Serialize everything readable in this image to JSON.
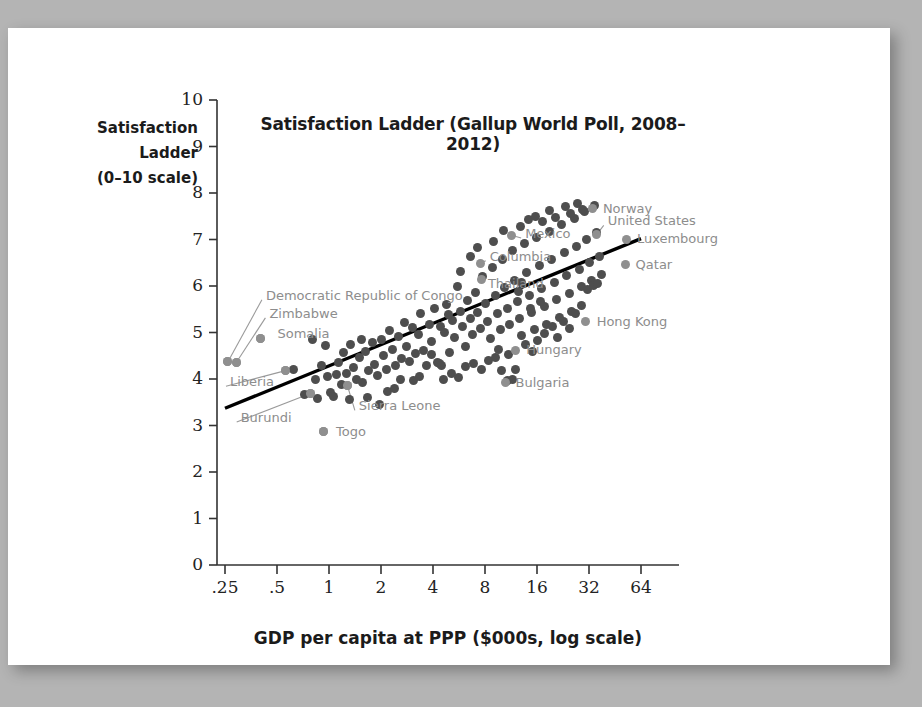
{
  "figure": {
    "title": "Satisfaction Ladder (Gallup World Poll, 2008–2012)",
    "y_axis_title_line1": "Satisfaction",
    "y_axis_title_line2": "Ladder",
    "y_axis_title_line3": "(0–10 scale)",
    "x_axis_title": "GDP per capita at PPP ($000s, log scale)"
  },
  "chart_data": {
    "type": "scatter",
    "title": "Satisfaction Ladder (Gallup World Poll, 2008–2012)",
    "xlabel": "GDP per capita at PPP ($000s, log scale)",
    "ylabel": "Satisfaction Ladder (0–10 scale)",
    "xscale": "log2",
    "xlim": [
      0.22,
      72
    ],
    "ylim": [
      0,
      10
    ],
    "grid": false,
    "legend": "none",
    "xticks": [
      0.25,
      0.5,
      1,
      2,
      4,
      8,
      16,
      32,
      64
    ],
    "xtick_labels": [
      ".25",
      ".5",
      "1",
      "2",
      "4",
      "8",
      "16",
      "32",
      "64"
    ],
    "yticks": [
      0,
      1,
      2,
      3,
      4,
      5,
      6,
      7,
      8,
      9,
      10
    ],
    "ytick_labels": [
      "0",
      "1",
      "2",
      "3",
      "4",
      "5",
      "6",
      "7",
      "8",
      "9",
      "10"
    ],
    "trend_line": {
      "label": "linear fit on log GDP",
      "x_start": 0.25,
      "y_start": 3.37,
      "x_end": 64.0,
      "y_end": 7.02,
      "color": "#000000"
    },
    "point_color": "#4e4e4e",
    "highlight_color": "#8f8f8f",
    "labeled_points": [
      {
        "name": "Democratic Republic of Congo",
        "x": 0.26,
        "y": 4.37,
        "label_x": 0.42,
        "label_y": 5.79,
        "leader": true
      },
      {
        "name": "Zimbabwe",
        "x": 0.29,
        "y": 4.35,
        "label_x": 0.44,
        "label_y": 5.4,
        "leader": true
      },
      {
        "name": "Somalia",
        "x": 0.4,
        "y": 4.88,
        "label_x": 0.49,
        "label_y": 4.97,
        "leader": false
      },
      {
        "name": "Liberia",
        "x": 0.56,
        "y": 4.18,
        "label_x": 0.26,
        "label_y": 3.93,
        "leader": true
      },
      {
        "name": "Burundi",
        "x": 0.78,
        "y": 3.69,
        "label_x": 0.3,
        "label_y": 3.16,
        "leader": true
      },
      {
        "name": "Sierra Leone",
        "x": 1.28,
        "y": 3.85,
        "label_x": 1.45,
        "label_y": 3.41,
        "leader": true
      },
      {
        "name": "Togo",
        "x": 0.93,
        "y": 2.87,
        "label_x": 1.07,
        "label_y": 2.87,
        "leader": false
      },
      {
        "name": "Thailand",
        "x": 7.6,
        "y": 6.13,
        "label_x": 8.1,
        "label_y": 6.04,
        "leader": false
      },
      {
        "name": "Columbia",
        "x": 7.5,
        "y": 6.48,
        "label_x": 8.3,
        "label_y": 6.63,
        "leader": true
      },
      {
        "name": "Mexico",
        "x": 11.4,
        "y": 7.09,
        "label_x": 13.3,
        "label_y": 7.12,
        "leader": true
      },
      {
        "name": "Bulgaria",
        "x": 10.5,
        "y": 3.92,
        "label_x": 11.7,
        "label_y": 3.92,
        "leader": false
      },
      {
        "name": "Hungary",
        "x": 12.0,
        "y": 4.62,
        "label_x": 13.5,
        "label_y": 4.62,
        "leader": false
      },
      {
        "name": "Hong Kong",
        "x": 30.5,
        "y": 5.23,
        "label_x": 34.5,
        "label_y": 5.23,
        "leader": false
      },
      {
        "name": "Norway",
        "x": 33.5,
        "y": 7.66,
        "label_x": 37.5,
        "label_y": 7.66,
        "leader": false
      },
      {
        "name": "United States",
        "x": 35.5,
        "y": 7.11,
        "label_x": 40.0,
        "label_y": 7.39,
        "leader": true
      },
      {
        "name": "Luxembourg",
        "x": 53.0,
        "y": 7.01,
        "label_x": 59.0,
        "label_y": 7.01,
        "leader": false
      },
      {
        "name": "Qatar",
        "x": 52.0,
        "y": 6.46,
        "label_x": 58.0,
        "label_y": 6.46,
        "leader": false
      }
    ],
    "points": [
      {
        "x": 0.26,
        "y": 4.37
      },
      {
        "x": 0.29,
        "y": 4.35
      },
      {
        "x": 0.4,
        "y": 4.88
      },
      {
        "x": 0.56,
        "y": 4.18
      },
      {
        "x": 0.78,
        "y": 3.69
      },
      {
        "x": 1.28,
        "y": 3.85
      },
      {
        "x": 0.93,
        "y": 2.87
      },
      {
        "x": 0.62,
        "y": 4.2
      },
      {
        "x": 0.72,
        "y": 3.66
      },
      {
        "x": 0.8,
        "y": 4.84
      },
      {
        "x": 0.83,
        "y": 4.0
      },
      {
        "x": 0.86,
        "y": 3.58
      },
      {
        "x": 0.9,
        "y": 4.28
      },
      {
        "x": 0.95,
        "y": 4.72
      },
      {
        "x": 0.98,
        "y": 4.05
      },
      {
        "x": 1.02,
        "y": 3.7
      },
      {
        "x": 1.06,
        "y": 3.62
      },
      {
        "x": 1.1,
        "y": 4.09
      },
      {
        "x": 1.14,
        "y": 4.36
      },
      {
        "x": 1.18,
        "y": 3.88
      },
      {
        "x": 1.22,
        "y": 4.58
      },
      {
        "x": 1.26,
        "y": 4.12
      },
      {
        "x": 1.32,
        "y": 3.55
      },
      {
        "x": 1.38,
        "y": 4.24
      },
      {
        "x": 1.44,
        "y": 4.0
      },
      {
        "x": 1.5,
        "y": 4.46
      },
      {
        "x": 1.56,
        "y": 3.92
      },
      {
        "x": 1.62,
        "y": 4.6
      },
      {
        "x": 1.7,
        "y": 4.18
      },
      {
        "x": 1.78,
        "y": 4.78
      },
      {
        "x": 1.84,
        "y": 4.32
      },
      {
        "x": 1.92,
        "y": 4.08
      },
      {
        "x": 2.0,
        "y": 4.86
      },
      {
        "x": 2.08,
        "y": 4.5
      },
      {
        "x": 2.16,
        "y": 4.2
      },
      {
        "x": 2.24,
        "y": 5.04
      },
      {
        "x": 2.34,
        "y": 4.64
      },
      {
        "x": 2.44,
        "y": 4.3
      },
      {
        "x": 2.54,
        "y": 4.92
      },
      {
        "x": 2.62,
        "y": 4.44
      },
      {
        "x": 2.72,
        "y": 5.22
      },
      {
        "x": 2.82,
        "y": 4.7
      },
      {
        "x": 2.94,
        "y": 4.38
      },
      {
        "x": 3.04,
        "y": 5.1
      },
      {
        "x": 3.16,
        "y": 4.55
      },
      {
        "x": 3.28,
        "y": 4.95
      },
      {
        "x": 3.4,
        "y": 5.4
      },
      {
        "x": 3.52,
        "y": 4.62
      },
      {
        "x": 3.66,
        "y": 4.28
      },
      {
        "x": 3.8,
        "y": 5.18
      },
      {
        "x": 3.94,
        "y": 4.8
      },
      {
        "x": 4.08,
        "y": 5.52
      },
      {
        "x": 4.22,
        "y": 4.36
      },
      {
        "x": 4.36,
        "y": 4.34
      },
      {
        "x": 4.5,
        "y": 4.3
      },
      {
        "x": 4.66,
        "y": 5.0
      },
      {
        "x": 4.82,
        "y": 5.6
      },
      {
        "x": 5.0,
        "y": 4.58
      },
      {
        "x": 5.18,
        "y": 5.26
      },
      {
        "x": 5.36,
        "y": 4.9
      },
      {
        "x": 5.54,
        "y": 6.0
      },
      {
        "x": 5.74,
        "y": 5.46
      },
      {
        "x": 5.94,
        "y": 5.12
      },
      {
        "x": 6.14,
        "y": 4.7
      },
      {
        "x": 6.36,
        "y": 5.68
      },
      {
        "x": 6.58,
        "y": 5.3
      },
      {
        "x": 6.8,
        "y": 4.96
      },
      {
        "x": 7.04,
        "y": 5.86
      },
      {
        "x": 7.28,
        "y": 5.44
      },
      {
        "x": 7.52,
        "y": 5.08
      },
      {
        "x": 7.78,
        "y": 6.2
      },
      {
        "x": 8.04,
        "y": 5.62
      },
      {
        "x": 8.3,
        "y": 5.24
      },
      {
        "x": 8.58,
        "y": 4.88
      },
      {
        "x": 8.86,
        "y": 6.4
      },
      {
        "x": 9.16,
        "y": 5.8
      },
      {
        "x": 9.46,
        "y": 5.4
      },
      {
        "x": 9.78,
        "y": 5.06
      },
      {
        "x": 10.1,
        "y": 6.56
      },
      {
        "x": 10.4,
        "y": 5.96
      },
      {
        "x": 10.8,
        "y": 5.52
      },
      {
        "x": 11.1,
        "y": 5.18
      },
      {
        "x": 11.5,
        "y": 6.76
      },
      {
        "x": 11.9,
        "y": 6.12
      },
      {
        "x": 12.3,
        "y": 5.66
      },
      {
        "x": 12.7,
        "y": 5.3
      },
      {
        "x": 13.1,
        "y": 4.94
      },
      {
        "x": 13.5,
        "y": 6.92
      },
      {
        "x": 14.0,
        "y": 6.28
      },
      {
        "x": 14.4,
        "y": 5.8
      },
      {
        "x": 14.9,
        "y": 5.42
      },
      {
        "x": 15.4,
        "y": 5.06
      },
      {
        "x": 15.9,
        "y": 7.04
      },
      {
        "x": 16.5,
        "y": 6.44
      },
      {
        "x": 17.0,
        "y": 5.94
      },
      {
        "x": 17.6,
        "y": 5.56
      },
      {
        "x": 18.2,
        "y": 5.18
      },
      {
        "x": 18.8,
        "y": 7.18
      },
      {
        "x": 19.4,
        "y": 6.58
      },
      {
        "x": 20.1,
        "y": 6.08
      },
      {
        "x": 20.8,
        "y": 5.7
      },
      {
        "x": 21.5,
        "y": 5.32
      },
      {
        "x": 22.2,
        "y": 7.32
      },
      {
        "x": 23.0,
        "y": 6.72
      },
      {
        "x": 23.8,
        "y": 6.22
      },
      {
        "x": 24.6,
        "y": 5.84
      },
      {
        "x": 25.4,
        "y": 5.46
      },
      {
        "x": 26.3,
        "y": 7.46
      },
      {
        "x": 27.2,
        "y": 6.86
      },
      {
        "x": 28.1,
        "y": 6.36
      },
      {
        "x": 29.0,
        "y": 5.98
      },
      {
        "x": 30.0,
        "y": 7.6
      },
      {
        "x": 31.0,
        "y": 7.0
      },
      {
        "x": 32.1,
        "y": 6.5
      },
      {
        "x": 33.2,
        "y": 6.12
      },
      {
        "x": 34.3,
        "y": 7.74
      },
      {
        "x": 35.5,
        "y": 7.14
      },
      {
        "x": 36.7,
        "y": 6.64
      },
      {
        "x": 37.9,
        "y": 6.24
      },
      {
        "x": 3.1,
        "y": 3.96
      },
      {
        "x": 3.34,
        "y": 4.06
      },
      {
        "x": 2.18,
        "y": 3.74
      },
      {
        "x": 2.4,
        "y": 3.8
      },
      {
        "x": 1.66,
        "y": 3.6
      },
      {
        "x": 1.96,
        "y": 3.46
      },
      {
        "x": 4.6,
        "y": 3.98
      },
      {
        "x": 5.1,
        "y": 4.12
      },
      {
        "x": 5.6,
        "y": 4.04
      },
      {
        "x": 6.2,
        "y": 4.26
      },
      {
        "x": 6.9,
        "y": 4.34
      },
      {
        "x": 7.6,
        "y": 4.2
      },
      {
        "x": 8.4,
        "y": 4.4
      },
      {
        "x": 9.2,
        "y": 4.46
      },
      {
        "x": 10.0,
        "y": 4.18
      },
      {
        "x": 11.0,
        "y": 4.52
      },
      {
        "x": 12.0,
        "y": 4.2
      },
      {
        "x": 10.8,
        "y": 3.96
      },
      {
        "x": 11.6,
        "y": 4.0
      },
      {
        "x": 9.6,
        "y": 4.64
      },
      {
        "x": 13.8,
        "y": 4.74
      },
      {
        "x": 15.0,
        "y": 4.6
      },
      {
        "x": 16.2,
        "y": 4.82
      },
      {
        "x": 17.8,
        "y": 4.98
      },
      {
        "x": 19.6,
        "y": 5.12
      },
      {
        "x": 21.0,
        "y": 4.9
      },
      {
        "x": 22.8,
        "y": 5.24
      },
      {
        "x": 24.8,
        "y": 5.08
      },
      {
        "x": 26.8,
        "y": 5.4
      },
      {
        "x": 28.8,
        "y": 5.58
      },
      {
        "x": 31.5,
        "y": 5.92
      },
      {
        "x": 34.0,
        "y": 6.02
      },
      {
        "x": 36.0,
        "y": 6.06
      },
      {
        "x": 13.0,
        "y": 6.08
      },
      {
        "x": 14.6,
        "y": 5.52
      },
      {
        "x": 16.8,
        "y": 5.66
      },
      {
        "x": 12.5,
        "y": 5.88
      },
      {
        "x": 9.0,
        "y": 6.96
      },
      {
        "x": 10.2,
        "y": 7.2
      },
      {
        "x": 12.8,
        "y": 7.28
      },
      {
        "x": 14.2,
        "y": 7.42
      },
      {
        "x": 15.6,
        "y": 7.5
      },
      {
        "x": 17.2,
        "y": 7.38
      },
      {
        "x": 19.0,
        "y": 7.62
      },
      {
        "x": 20.4,
        "y": 7.48
      },
      {
        "x": 23.5,
        "y": 7.72
      },
      {
        "x": 25.0,
        "y": 7.56
      },
      {
        "x": 27.5,
        "y": 7.78
      },
      {
        "x": 29.5,
        "y": 7.64
      },
      {
        "x": 6.6,
        "y": 6.64
      },
      {
        "x": 7.2,
        "y": 6.82
      },
      {
        "x": 5.8,
        "y": 6.32
      },
      {
        "x": 4.9,
        "y": 5.38
      },
      {
        "x": 4.4,
        "y": 5.12
      },
      {
        "x": 3.9,
        "y": 4.52
      },
      {
        "x": 2.6,
        "y": 3.98
      },
      {
        "x": 1.54,
        "y": 4.84
      },
      {
        "x": 1.34,
        "y": 4.74
      }
    ]
  }
}
